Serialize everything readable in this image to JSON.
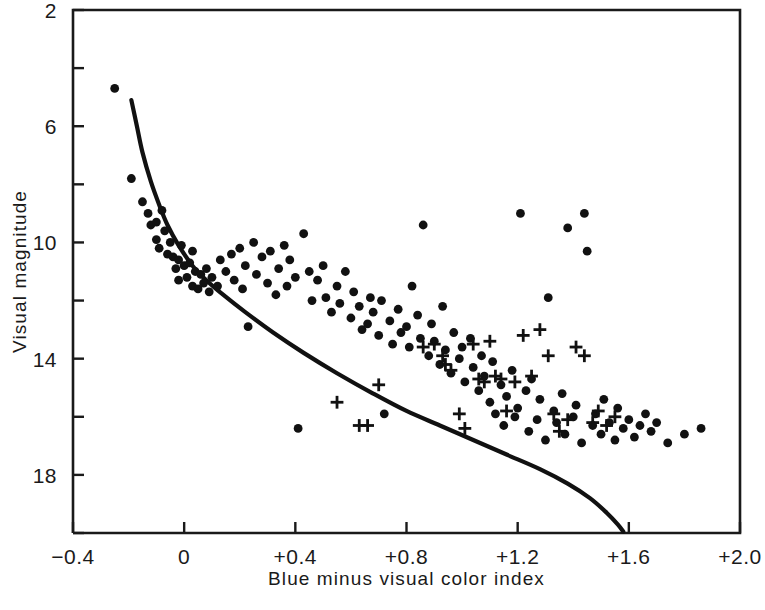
{
  "chart_data": {
    "type": "scatter",
    "title": "",
    "xlabel": "Blue minus visual color index",
    "ylabel": "Visual magnitude",
    "xlim": [
      -0.4,
      2.0
    ],
    "ylim": [
      20.0,
      2.0
    ],
    "y_inverted": true,
    "grid": false,
    "legend": "none",
    "axis_color": "#1a1a1a",
    "marker_color": "#111111",
    "curve_color": "#111111",
    "xticks": [
      -0.4,
      0,
      0.4,
      0.8,
      1.2,
      1.6,
      2.0
    ],
    "xtick_labels": [
      "−0.4",
      "0",
      "+0.4",
      "+0.8",
      "+1.2",
      "+1.6",
      "+2.0"
    ],
    "yticks": [
      2,
      6,
      10,
      14,
      18
    ],
    "ytick_labels": [
      "2",
      "6",
      "10",
      "14",
      "18"
    ],
    "y_minor_ticks": [
      4,
      8,
      12,
      16,
      20
    ],
    "series": [
      {
        "name": "dots",
        "marker": "circle",
        "points": [
          [
            -0.25,
            4.7
          ],
          [
            -0.19,
            7.8
          ],
          [
            -0.15,
            8.6
          ],
          [
            -0.13,
            9.0
          ],
          [
            -0.12,
            9.4
          ],
          [
            -0.1,
            9.3
          ],
          [
            -0.1,
            9.9
          ],
          [
            -0.09,
            10.2
          ],
          [
            -0.08,
            8.9
          ],
          [
            -0.07,
            9.6
          ],
          [
            -0.06,
            10.4
          ],
          [
            -0.05,
            10.0
          ],
          [
            -0.04,
            10.5
          ],
          [
            -0.03,
            10.9
          ],
          [
            -0.02,
            10.6
          ],
          [
            -0.02,
            11.3
          ],
          [
            -0.01,
            10.1
          ],
          [
            0.0,
            10.8
          ],
          [
            0.01,
            11.2
          ],
          [
            0.02,
            10.7
          ],
          [
            0.03,
            11.5
          ],
          [
            0.03,
            10.3
          ],
          [
            0.04,
            11.0
          ],
          [
            0.05,
            11.6
          ],
          [
            0.06,
            11.1
          ],
          [
            0.07,
            11.4
          ],
          [
            0.08,
            10.9
          ],
          [
            0.09,
            11.7
          ],
          [
            0.1,
            11.2
          ],
          [
            0.12,
            11.5
          ],
          [
            0.13,
            10.6
          ],
          [
            0.15,
            11.0
          ],
          [
            0.17,
            10.4
          ],
          [
            0.18,
            11.3
          ],
          [
            0.2,
            10.2
          ],
          [
            0.21,
            11.6
          ],
          [
            0.22,
            10.8
          ],
          [
            0.23,
            12.9
          ],
          [
            0.25,
            10.0
          ],
          [
            0.26,
            11.1
          ],
          [
            0.28,
            10.5
          ],
          [
            0.3,
            11.4
          ],
          [
            0.31,
            10.3
          ],
          [
            0.33,
            11.8
          ],
          [
            0.34,
            10.9
          ],
          [
            0.36,
            10.1
          ],
          [
            0.37,
            11.5
          ],
          [
            0.38,
            10.6
          ],
          [
            0.4,
            11.2
          ],
          [
            0.41,
            16.4
          ],
          [
            0.43,
            9.7
          ],
          [
            0.45,
            11.0
          ],
          [
            0.46,
            12.0
          ],
          [
            0.48,
            11.3
          ],
          [
            0.5,
            10.8
          ],
          [
            0.51,
            11.9
          ],
          [
            0.53,
            12.4
          ],
          [
            0.55,
            11.5
          ],
          [
            0.56,
            12.1
          ],
          [
            0.58,
            11.0
          ],
          [
            0.6,
            12.6
          ],
          [
            0.61,
            11.7
          ],
          [
            0.63,
            12.2
          ],
          [
            0.64,
            13.0
          ],
          [
            0.66,
            12.8
          ],
          [
            0.67,
            11.9
          ],
          [
            0.68,
            12.4
          ],
          [
            0.7,
            13.2
          ],
          [
            0.71,
            12.0
          ],
          [
            0.72,
            15.9
          ],
          [
            0.74,
            12.7
          ],
          [
            0.75,
            13.5
          ],
          [
            0.77,
            12.3
          ],
          [
            0.78,
            13.1
          ],
          [
            0.8,
            12.9
          ],
          [
            0.81,
            13.6
          ],
          [
            0.82,
            11.5
          ],
          [
            0.84,
            12.5
          ],
          [
            0.85,
            13.3
          ],
          [
            0.86,
            9.4
          ],
          [
            0.88,
            13.9
          ],
          [
            0.89,
            12.8
          ],
          [
            0.9,
            13.4
          ],
          [
            0.92,
            14.2
          ],
          [
            0.93,
            12.2
          ],
          [
            0.94,
            13.7
          ],
          [
            0.96,
            14.5
          ],
          [
            0.97,
            13.1
          ],
          [
            0.99,
            14.0
          ],
          [
            1.0,
            13.6
          ],
          [
            1.01,
            14.8
          ],
          [
            1.03,
            13.3
          ],
          [
            1.04,
            14.3
          ],
          [
            1.06,
            15.1
          ],
          [
            1.07,
            13.9
          ],
          [
            1.08,
            14.6
          ],
          [
            1.1,
            15.5
          ],
          [
            1.11,
            14.1
          ],
          [
            1.12,
            15.9
          ],
          [
            1.14,
            14.9
          ],
          [
            1.15,
            16.3
          ],
          [
            1.16,
            15.3
          ],
          [
            1.18,
            14.4
          ],
          [
            1.19,
            16.0
          ],
          [
            1.2,
            15.7
          ],
          [
            1.21,
            9.0
          ],
          [
            1.23,
            15.1
          ],
          [
            1.24,
            16.5
          ],
          [
            1.25,
            14.7
          ],
          [
            1.27,
            16.1
          ],
          [
            1.28,
            15.4
          ],
          [
            1.3,
            16.8
          ],
          [
            1.31,
            11.9
          ],
          [
            1.33,
            15.8
          ],
          [
            1.34,
            16.2
          ],
          [
            1.36,
            15.2
          ],
          [
            1.37,
            16.6
          ],
          [
            1.38,
            9.5
          ],
          [
            1.4,
            16.0
          ],
          [
            1.41,
            15.6
          ],
          [
            1.43,
            16.9
          ],
          [
            1.44,
            9.0
          ],
          [
            1.45,
            10.3
          ],
          [
            1.47,
            16.3
          ],
          [
            1.48,
            15.9
          ],
          [
            1.5,
            16.6
          ],
          [
            1.51,
            15.4
          ],
          [
            1.53,
            16.2
          ],
          [
            1.55,
            16.8
          ],
          [
            1.56,
            15.7
          ],
          [
            1.58,
            16.4
          ],
          [
            1.6,
            16.1
          ],
          [
            1.62,
            16.7
          ],
          [
            1.64,
            16.3
          ],
          [
            1.66,
            15.9
          ],
          [
            1.68,
            16.5
          ],
          [
            1.7,
            16.2
          ],
          [
            1.74,
            16.9
          ],
          [
            1.8,
            16.6
          ],
          [
            1.86,
            16.4
          ]
        ]
      },
      {
        "name": "crosses",
        "marker": "plus",
        "points": [
          [
            0.55,
            15.5
          ],
          [
            0.63,
            16.3
          ],
          [
            0.66,
            16.3
          ],
          [
            0.7,
            14.9
          ],
          [
            0.86,
            13.6
          ],
          [
            0.9,
            13.5
          ],
          [
            0.93,
            13.9
          ],
          [
            0.94,
            14.2
          ],
          [
            0.96,
            14.4
          ],
          [
            0.99,
            15.9
          ],
          [
            1.01,
            16.4
          ],
          [
            1.04,
            13.5
          ],
          [
            1.06,
            14.7
          ],
          [
            1.08,
            14.8
          ],
          [
            1.1,
            13.4
          ],
          [
            1.12,
            14.6
          ],
          [
            1.14,
            14.7
          ],
          [
            1.16,
            15.8
          ],
          [
            1.19,
            14.8
          ],
          [
            1.22,
            13.2
          ],
          [
            1.25,
            14.6
          ],
          [
            1.28,
            13.0
          ],
          [
            1.31,
            13.9
          ],
          [
            1.33,
            15.9
          ],
          [
            1.35,
            16.5
          ],
          [
            1.38,
            16.1
          ],
          [
            1.41,
            13.6
          ],
          [
            1.44,
            13.9
          ],
          [
            1.47,
            16.2
          ],
          [
            1.49,
            15.8
          ],
          [
            1.52,
            16.3
          ],
          [
            1.55,
            16.0
          ]
        ]
      }
    ],
    "curve": {
      "name": "main-sequence",
      "points": [
        [
          -0.19,
          5.1
        ],
        [
          -0.17,
          6.0
        ],
        [
          -0.15,
          6.9
        ],
        [
          -0.12,
          7.9
        ],
        [
          -0.09,
          8.7
        ],
        [
          -0.06,
          9.4
        ],
        [
          -0.02,
          10.1
        ],
        [
          0.03,
          10.8
        ],
        [
          0.08,
          11.3
        ],
        [
          0.14,
          11.8
        ],
        [
          0.22,
          12.4
        ],
        [
          0.32,
          13.1
        ],
        [
          0.43,
          13.8
        ],
        [
          0.55,
          14.5
        ],
        [
          0.68,
          15.2
        ],
        [
          0.8,
          15.8
        ],
        [
          0.92,
          16.3
        ],
        [
          1.04,
          16.8
        ],
        [
          1.16,
          17.3
        ],
        [
          1.28,
          17.8
        ],
        [
          1.38,
          18.3
        ],
        [
          1.46,
          18.8
        ],
        [
          1.52,
          19.3
        ],
        [
          1.56,
          19.7
        ],
        [
          1.58,
          19.95
        ]
      ]
    }
  }
}
